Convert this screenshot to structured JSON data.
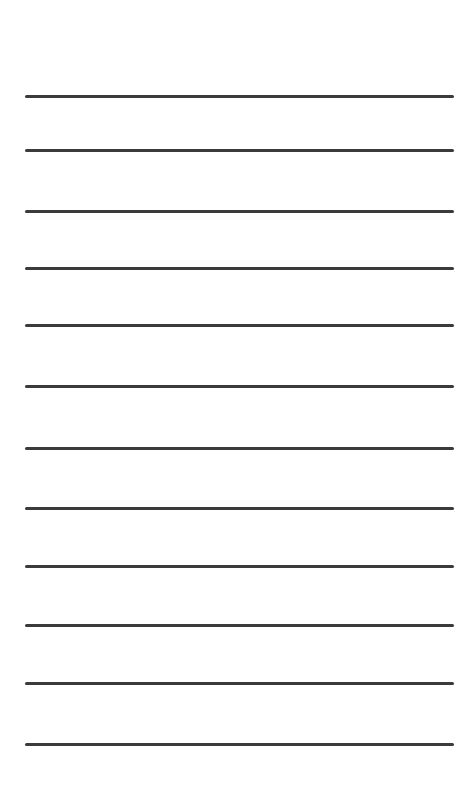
{
  "page": {
    "type": "lined-paper",
    "background_color": "#ffffff",
    "line_color": "#3b3b3b",
    "line_thickness_px": 3,
    "line_left_px": 25,
    "line_right_px": 454,
    "line_count": 12,
    "line_y_positions": [
      96,
      150,
      211,
      268,
      325,
      386,
      448,
      508,
      566,
      625,
      683,
      744
    ]
  }
}
